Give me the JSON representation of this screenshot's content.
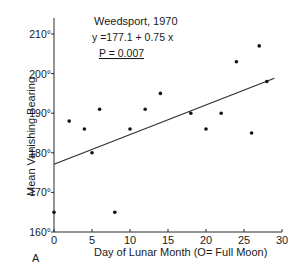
{
  "chart_data": {
    "type": "scatter",
    "title": "Weedsport, 1970",
    "annotations": [
      "y = 177.1 + 0.75 x",
      "P = 0.007"
    ],
    "xlabel": "Day of Lunar Month (O= Full Moon)",
    "ylabel": "Mean Vanishing Bearing",
    "panel_label": "A",
    "xlim": [
      0,
      30
    ],
    "ylim": [
      160,
      212
    ],
    "x_ticks": [
      0,
      5,
      10,
      15,
      20,
      25,
      30
    ],
    "y_ticks": [
      160,
      170,
      180,
      190,
      200,
      210
    ],
    "y_tick_labels": [
      "160°",
      "170°",
      "180°",
      "190°",
      "200°",
      "210°"
    ],
    "grid": false,
    "legend": null,
    "series": [
      {
        "name": "Mean vanishing bearing",
        "points": [
          {
            "x": 0,
            "y": 165
          },
          {
            "x": 2,
            "y": 188
          },
          {
            "x": 4,
            "y": 186
          },
          {
            "x": 5,
            "y": 180
          },
          {
            "x": 6,
            "y": 191
          },
          {
            "x": 8,
            "y": 165
          },
          {
            "x": 10,
            "y": 186
          },
          {
            "x": 12,
            "y": 191
          },
          {
            "x": 14,
            "y": 195
          },
          {
            "x": 18,
            "y": 190
          },
          {
            "x": 20,
            "y": 186
          },
          {
            "x": 22,
            "y": 190
          },
          {
            "x": 24,
            "y": 203
          },
          {
            "x": 26,
            "y": 185
          },
          {
            "x": 27,
            "y": 207
          },
          {
            "x": 28,
            "y": 198
          }
        ]
      }
    ],
    "regression": {
      "intercept": 177.1,
      "slope": 0.75,
      "x_start": 0,
      "x_end": 29
    }
  },
  "labels": {
    "title": "Weedsport, 1970",
    "equation": "y =177.1 + 0.75 x",
    "p_value": "P = 0.007",
    "xlabel": "Day of Lunar Month  (O= Full Moon)",
    "ylabel": "Mean Vanishing Bearing",
    "panel": "A"
  }
}
